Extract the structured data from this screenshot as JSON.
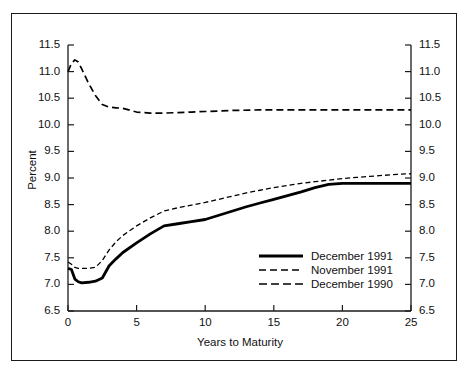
{
  "chart_data": {
    "type": "line",
    "title": "",
    "xlabel": "Years to Maturity",
    "ylabel": "Percent",
    "xlim": [
      0,
      25
    ],
    "ylim": [
      6.5,
      11.5
    ],
    "xticks": [
      "0",
      "5",
      "10",
      "15",
      "20",
      "25"
    ],
    "yticks": [
      "6.5",
      "7.0",
      "7.5",
      "8.0",
      "8.5",
      "9.0",
      "9.5",
      "10.0",
      "10.5",
      "11.0",
      "11.5"
    ],
    "yticks_right": [
      "6.5",
      "7.0",
      "7.5",
      "8.0",
      "8.5",
      "9.0",
      "9.5",
      "10.0",
      "10.5",
      "11.0",
      "11.5"
    ],
    "grid": false,
    "legend_position": "lower right",
    "dual_y_axis": true,
    "series": [
      {
        "name": "December 1991",
        "style": "solid",
        "color": "#000000",
        "x": [
          0,
          0.25,
          0.5,
          0.75,
          1,
          1.5,
          2,
          2.5,
          3,
          3.5,
          4,
          5,
          6,
          7,
          8,
          9,
          10,
          11,
          12,
          13,
          14,
          15,
          16,
          17,
          18,
          19,
          20,
          21,
          22,
          23,
          24,
          25
        ],
        "y": [
          7.3,
          7.28,
          7.1,
          7.05,
          7.03,
          7.04,
          7.06,
          7.12,
          7.35,
          7.48,
          7.6,
          7.78,
          7.95,
          8.1,
          8.14,
          8.18,
          8.22,
          8.3,
          8.38,
          8.46,
          8.53,
          8.6,
          8.67,
          8.74,
          8.82,
          8.88,
          8.9,
          8.9,
          8.9,
          8.9,
          8.9,
          8.9
        ]
      },
      {
        "name": "November 1991",
        "style": "dashed-fine",
        "color": "#000000",
        "x": [
          0,
          0.25,
          0.5,
          0.75,
          1,
          1.5,
          2,
          2.5,
          3,
          3.5,
          4,
          5,
          6,
          7,
          8,
          9,
          10,
          11,
          12,
          13,
          14,
          15,
          16,
          17,
          18,
          19,
          20,
          21,
          22,
          23,
          24,
          25
        ],
        "y": [
          7.42,
          7.38,
          7.32,
          7.3,
          7.3,
          7.3,
          7.32,
          7.45,
          7.65,
          7.8,
          7.92,
          8.1,
          8.25,
          8.38,
          8.44,
          8.49,
          8.54,
          8.6,
          8.66,
          8.72,
          8.77,
          8.82,
          8.86,
          8.9,
          8.93,
          8.96,
          8.99,
          9.01,
          9.03,
          9.05,
          9.07,
          9.08
        ]
      },
      {
        "name": "December 1990",
        "style": "dashed",
        "color": "#000000",
        "x": [
          0,
          0.25,
          0.5,
          0.75,
          1,
          1.5,
          2,
          2.5,
          3,
          3.5,
          4,
          5,
          6,
          7,
          8,
          9,
          10,
          12,
          14,
          16,
          18,
          20,
          22,
          24,
          25
        ],
        "y": [
          11.0,
          11.15,
          11.22,
          11.18,
          11.05,
          10.78,
          10.55,
          10.38,
          10.33,
          10.32,
          10.31,
          10.24,
          10.22,
          10.22,
          10.23,
          10.24,
          10.25,
          10.27,
          10.28,
          10.28,
          10.28,
          10.28,
          10.28,
          10.28,
          10.28
        ]
      }
    ]
  },
  "legend": {
    "items": [
      {
        "label": "December 1991"
      },
      {
        "label": "November 1991"
      },
      {
        "label": "December 1990"
      }
    ]
  }
}
